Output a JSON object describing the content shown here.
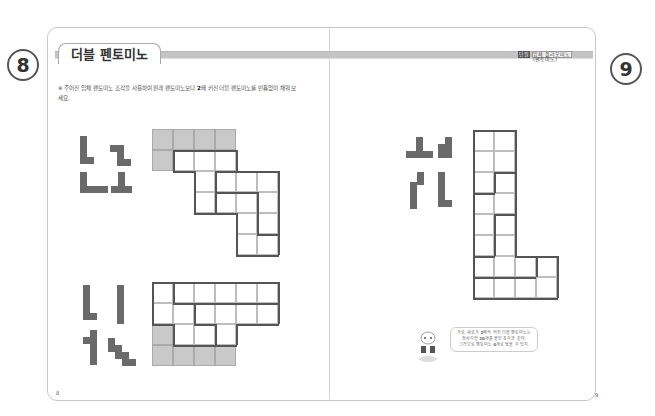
{
  "left_page": {
    "page_badge": "8",
    "title": "더블 펜토미노",
    "instruction_prefix": "※ 주어진 입체 펜토미노 조각을 사용하여 원래 펜토미노보다 ",
    "instruction_bold": "2",
    "instruction_suffix": "배 커진 더블 펜토미노를 빈틈없이 채워 보세요.",
    "page_number": "8",
    "puzzles": [
      {
        "name": "puzzle-1",
        "pieces": [
          "L-pentomino",
          "S-like-pentomino",
          "L-pentomino",
          "inverted-T-pentomino"
        ]
      },
      {
        "name": "puzzle-2",
        "pieces": [
          "L-pentomino",
          "I-pentomino",
          "plus-like-pentomino",
          "W-pentomino"
        ]
      }
    ]
  },
  "right_page": {
    "page_badge": "9",
    "tag_label": "단원",
    "tag_text": "입체 폴리오미노(펜토미노)",
    "page_number": "9",
    "puzzles": [
      {
        "name": "puzzle-3",
        "pieces": [
          "T-pentomino",
          "P-pentomino",
          "N-pentomino",
          "L-pentomino"
        ]
      }
    ],
    "hint_bubble": {
      "line1_prefix": "가로, 세로가 ",
      "line1_bold": "2",
      "line1_suffix": "배씩 커진 더블 펜토미노는",
      "line2_prefix": "정사각형 ",
      "line2_bold": "20",
      "line2_suffix": "개를 붙인 조각과 같아.",
      "line3_prefix": "그러므로 펜토미노 ",
      "line3_bold": "4",
      "line3_suffix": "개로 덮을 수 있지."
    }
  },
  "colors": {
    "piece": "#6a6a6a",
    "shade": "#c9c9c9",
    "outline": "#555555",
    "band": "#c4c4c4"
  }
}
